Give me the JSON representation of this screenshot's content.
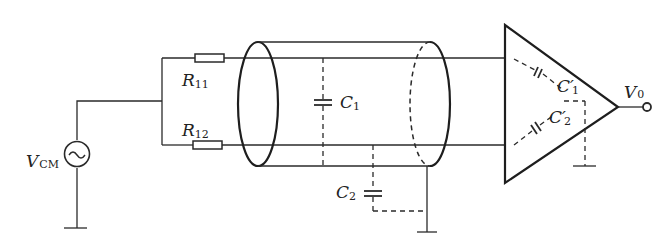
{
  "diagram": {
    "type": "circuit",
    "source": {
      "label": "V",
      "subscript": "CM",
      "icon": "ac-source-icon"
    },
    "resistors": [
      {
        "label": "R",
        "subscript": "11"
      },
      {
        "label": "R",
        "subscript": "12"
      }
    ],
    "cable_capacitors": [
      {
        "label": "C",
        "subscript": "1"
      },
      {
        "label": "C",
        "subscript": "2"
      }
    ],
    "amplifier_capacitors": [
      {
        "label": "C′",
        "subscript": "1"
      },
      {
        "label": "C′",
        "subscript": "2"
      }
    ],
    "output": {
      "label": "V",
      "subscript": "0"
    }
  }
}
